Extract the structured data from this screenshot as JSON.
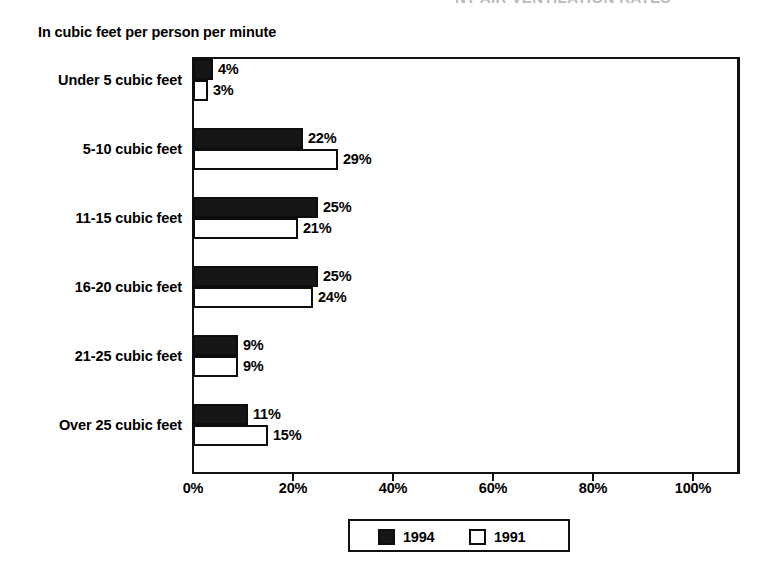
{
  "header": {
    "clipped_title": "NT AIR VENTILATION RATES"
  },
  "chart_data": {
    "type": "bar",
    "orientation": "horizontal",
    "title": "",
    "subtitle": "In cubic feet per person per minute",
    "xlabel": "",
    "ylabel": "",
    "xlim": [
      0,
      108
    ],
    "xticks": [
      0,
      20,
      40,
      60,
      80,
      100
    ],
    "xtick_labels": [
      "0%",
      "20%",
      "40%",
      "60%",
      "80%",
      "100%"
    ],
    "grid": false,
    "legend_position": "bottom-center",
    "categories": [
      "Under 5 cubic feet",
      "5-10 cubic feet",
      "11-15 cubic feet",
      "16-20 cubic feet",
      "21-25 cubic feet",
      "Over 25 cubic feet"
    ],
    "series": [
      {
        "name": "1994",
        "color": "#161616",
        "values": [
          4,
          22,
          25,
          25,
          9,
          11
        ],
        "value_labels": [
          "4%",
          "22%",
          "25%",
          "25%",
          "9%",
          "11%"
        ]
      },
      {
        "name": "1991",
        "color": "#ffffff",
        "values": [
          3,
          29,
          21,
          24,
          9,
          15
        ],
        "value_labels": [
          "3%",
          "29%",
          "21%",
          "24%",
          "9%",
          "15%"
        ]
      }
    ]
  },
  "legend": {
    "entries": [
      {
        "label": "1994",
        "swatch": "filled-black"
      },
      {
        "label": "1991",
        "swatch": "outlined-white"
      }
    ]
  }
}
